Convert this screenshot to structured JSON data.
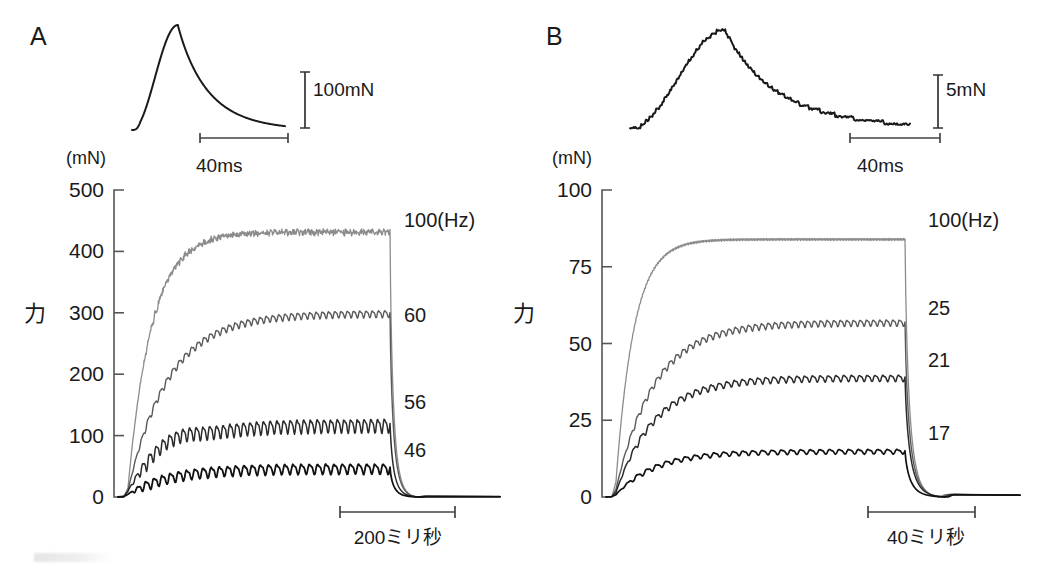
{
  "figure": {
    "background_color": "#ffffff",
    "text_color": "#1a1a1a"
  },
  "panels": [
    {
      "id": "A",
      "letter": "A",
      "twitch": {
        "description": "single twitch, smooth rise and slow decay",
        "force_cal_label": "100mN",
        "time_cal_label": "40ms",
        "color": "#1a1a1a",
        "noise": 0.0
      },
      "axis": {
        "unit_label": "(mN)",
        "title": "力",
        "ticks": [
          0,
          100,
          200,
          300,
          400,
          500
        ],
        "ylim": [
          0,
          500
        ]
      },
      "time_scalebar": {
        "label": "200ミリ秒",
        "duration_ms": 200
      },
      "series": [
        {
          "label": "100(Hz)",
          "frequency_hz": 100,
          "plateau": 432,
          "peak": 445,
          "initial_rise": 60,
          "ripple": 6,
          "color": "#8c8c8c",
          "width": 1.3
        },
        {
          "label": "60",
          "frequency_hz": 60,
          "plateau": 300,
          "peak": 315,
          "initial_rise": 42,
          "ripple": 16,
          "color": "#5a5a5a",
          "width": 1.4
        },
        {
          "label": "56",
          "frequency_hz": 56,
          "plateau": 125,
          "peak": 160,
          "initial_rise": 30,
          "ripple": 32,
          "color": "#2b2b2b",
          "width": 1.5
        },
        {
          "label": "46",
          "frequency_hz": 46,
          "plateau": 48,
          "peak": 70,
          "initial_rise": 18,
          "ripple": 24,
          "color": "#111111",
          "width": 1.8
        }
      ]
    },
    {
      "id": "B",
      "letter": "B",
      "twitch": {
        "description": "single twitch, noisy stepped rise and decay",
        "force_cal_label": "5mN",
        "time_cal_label": "40ms",
        "color": "#1a1a1a",
        "noise": 0.9
      },
      "axis": {
        "unit_label": "(mN)",
        "title": "力",
        "ticks": [
          0,
          25,
          50,
          75,
          100
        ],
        "ylim": [
          0,
          100
        ]
      },
      "time_scalebar": {
        "label": "40ミリ秒",
        "duration_ms": 40
      },
      "series": [
        {
          "label": "100(Hz)",
          "frequency_hz": 100,
          "plateau": 84,
          "peak": 86,
          "initial_rise": 20,
          "ripple": 1.0,
          "color": "#8c8c8c",
          "width": 1.3
        },
        {
          "label": "25",
          "frequency_hz": 25,
          "plateau": 57,
          "peak": 60,
          "initial_rise": 10,
          "ripple": 3.0,
          "color": "#5a5a5a",
          "width": 1.4
        },
        {
          "label": "21",
          "frequency_hz": 21,
          "plateau": 39,
          "peak": 42,
          "initial_rise": 6,
          "ripple": 3.0,
          "color": "#2b2b2b",
          "width": 1.5
        },
        {
          "label": "17",
          "frequency_hz": 17,
          "plateau": 15,
          "peak": 17,
          "initial_rise": 3,
          "ripple": 2.2,
          "color": "#111111",
          "width": 1.7
        }
      ]
    }
  ]
}
